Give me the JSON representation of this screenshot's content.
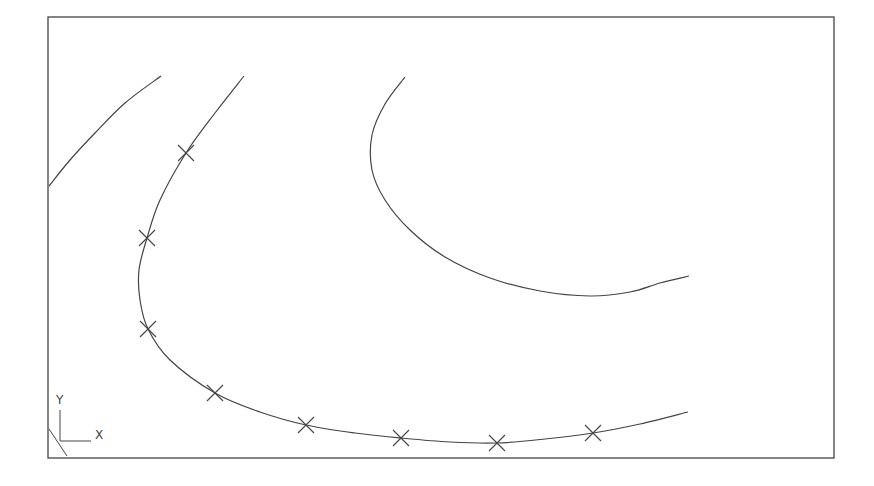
{
  "drawing": {
    "viewport": {
      "x": 48,
      "y": 17,
      "width": 786,
      "height": 441
    },
    "line_color": "#444444",
    "curves": [
      {
        "name": "left-curve",
        "points": [
          [
            49,
            186
          ],
          [
            70,
            160
          ],
          [
            95,
            133
          ],
          [
            125,
            103
          ],
          [
            161,
            76
          ]
        ]
      },
      {
        "name": "middle-curve-fitted-spline",
        "points": [
          [
            244,
            76
          ],
          [
            215,
            113
          ],
          [
            186,
            153
          ],
          [
            160,
            200
          ],
          [
            147,
            238
          ],
          [
            139,
            270
          ],
          [
            140,
            300
          ],
          [
            148,
            329
          ],
          [
            170,
            360
          ],
          [
            215,
            393
          ],
          [
            260,
            412
          ],
          [
            306,
            425
          ],
          [
            355,
            433
          ],
          [
            401,
            438
          ],
          [
            450,
            442
          ],
          [
            497,
            443
          ],
          [
            545,
            439
          ],
          [
            593,
            433
          ],
          [
            640,
            424
          ],
          [
            688,
            412
          ]
        ]
      },
      {
        "name": "right-curve",
        "points": [
          [
            405,
            77
          ],
          [
            385,
            104
          ],
          [
            372,
            135
          ],
          [
            372,
            170
          ],
          [
            385,
            200
          ],
          [
            410,
            230
          ],
          [
            445,
            257
          ],
          [
            490,
            278
          ],
          [
            540,
            291
          ],
          [
            590,
            296
          ],
          [
            630,
            292
          ],
          [
            660,
            283
          ],
          [
            689,
            276
          ]
        ]
      }
    ],
    "fit_point_markers": [
      [
        186,
        153
      ],
      [
        147,
        238
      ],
      [
        148,
        329
      ],
      [
        215,
        393
      ],
      [
        306,
        425
      ],
      [
        401,
        438
      ],
      [
        497,
        443
      ],
      [
        593,
        433
      ]
    ],
    "ucs_icon": {
      "origin": [
        60,
        441
      ],
      "x_label": "X",
      "y_label": "Y"
    }
  }
}
